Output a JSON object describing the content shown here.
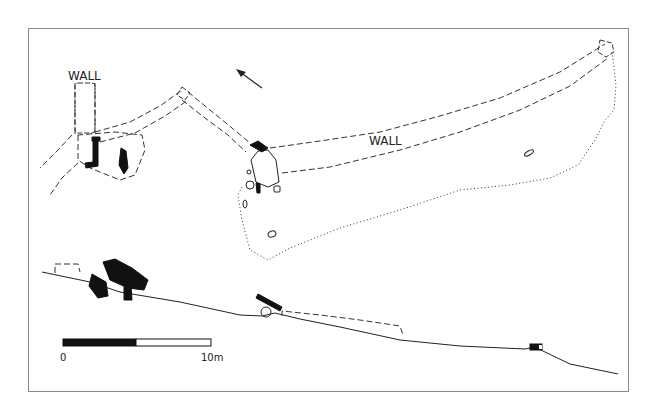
{
  "figure": {
    "type": "archaeological-site-plan-and-profile",
    "labels": {
      "wall_left": "WALL",
      "wall_right": "WALL"
    },
    "north_arrow": {
      "icon": "north-arrow-icon",
      "direction": "north-west"
    },
    "scale_bar": {
      "start_label": "0",
      "end_label": "10m",
      "segments": [
        {
          "fill": "#111111",
          "length_m": 5
        },
        {
          "fill": "#ffffff",
          "length_m": 5
        }
      ]
    },
    "colors": {
      "border": "#8a8a8a",
      "ink": "#222222",
      "background": "#ffffff"
    }
  }
}
